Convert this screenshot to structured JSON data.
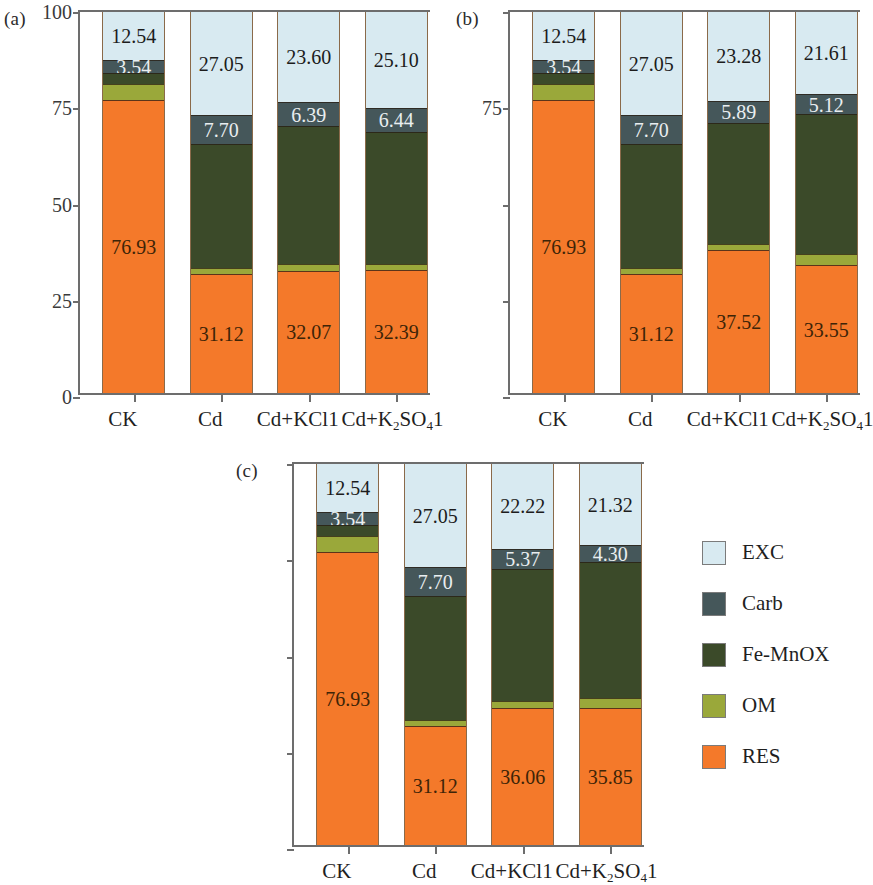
{
  "figure": {
    "series_order": [
      "RES",
      "OM",
      "Fe-MnOX",
      "Carb",
      "EXC"
    ],
    "colors": {
      "EXC": "#d8eaf1",
      "Carb": "#45575a",
      "Fe-MnOX": "#3b4a29",
      "OM": "#9aa83a",
      "RES": "#f4792a",
      "axis": "#6d6d6d",
      "bar_outline": "#8a6a4a"
    }
  },
  "legend": {
    "position": "right-middle",
    "items": [
      {
        "label": "EXC",
        "color": "#d8eaf1"
      },
      {
        "label": "Carb",
        "color": "#45575a"
      },
      {
        "label": "Fe-MnOX",
        "color": "#3b4a29"
      },
      {
        "label": "OM",
        "color": "#9aa83a"
      },
      {
        "label": "RES",
        "color": "#f4792a"
      }
    ]
  },
  "panels": [
    {
      "tag": "(a)",
      "ylabel": "百分比(%)",
      "ytick_labels": [
        "100",
        "75",
        "50",
        "25",
        "0"
      ],
      "ytick_values": [
        100,
        75,
        50,
        25,
        0
      ],
      "categories": [
        "CK",
        "Cd",
        "Cd+KCl1",
        "Cd+K2SO41"
      ],
      "category_labels_html": [
        "CK",
        "Cd",
        "Cd+KCl1",
        "Cd+K<sub>2</sub>SO<sub>4</sub>1"
      ],
      "bars": [
        {
          "category": "CK",
          "RES": 76.93,
          "OM": 4.1,
          "Fe-MnOX": 2.89,
          "Carb": 3.54,
          "EXC": 12.54,
          "labels": {
            "RES": "76.93",
            "Carb": "3.54",
            "EXC": "12.54"
          }
        },
        {
          "category": "Cd",
          "RES": 31.12,
          "OM": 1.63,
          "Fe-MnOX": 32.5,
          "Carb": 7.7,
          "EXC": 27.05,
          "labels": {
            "RES": "31.12",
            "Carb": "7.70",
            "EXC": "27.05"
          }
        },
        {
          "category": "Cd+KCl1",
          "RES": 32.07,
          "OM": 1.8,
          "Fe-MnOX": 36.14,
          "Carb": 6.39,
          "EXC": 23.6,
          "labels": {
            "RES": "32.07",
            "Carb": "6.39",
            "EXC": "23.60"
          }
        },
        {
          "category": "Cd+K2SO41",
          "RES": 32.39,
          "OM": 1.5,
          "Fe-MnOX": 34.57,
          "Carb": 6.44,
          "EXC": 25.1,
          "labels": {
            "RES": "32.39",
            "Carb": "6.44",
            "EXC": "25.10"
          }
        }
      ]
    },
    {
      "tag": "(b)",
      "ylabel": "",
      "ytick_labels": [
        "",
        "75",
        "",
        "",
        ""
      ],
      "ytick_values": [
        100,
        75,
        50,
        25,
        0
      ],
      "categories": [
        "CK",
        "Cd",
        "Cd+KCl1",
        "Cd+K2SO41"
      ],
      "category_labels_html": [
        "CK",
        "Cd",
        "Cd+KCl1",
        "Cd+K<sub>2</sub>SO<sub>4</sub>1"
      ],
      "bars": [
        {
          "category": "CK",
          "RES": 76.93,
          "OM": 4.1,
          "Fe-MnOX": 2.89,
          "Carb": 3.54,
          "EXC": 12.54,
          "labels": {
            "RES": "76.93",
            "Carb": "3.54",
            "EXC": "12.54"
          }
        },
        {
          "category": "Cd",
          "RES": 31.12,
          "OM": 1.63,
          "Fe-MnOX": 32.5,
          "Carb": 7.7,
          "EXC": 27.05,
          "labels": {
            "RES": "31.12",
            "Carb": "7.70",
            "EXC": "27.05"
          }
        },
        {
          "category": "Cd+KCl1",
          "RES": 37.52,
          "OM": 1.5,
          "Fe-MnOX": 31.81,
          "Carb": 5.89,
          "EXC": 23.28,
          "labels": {
            "RES": "37.52",
            "Carb": "5.89",
            "EXC": "23.28"
          }
        },
        {
          "category": "Cd+K2SO41",
          "RES": 33.55,
          "OM": 2.8,
          "Fe-MnOX": 36.92,
          "Carb": 5.12,
          "EXC": 21.61,
          "labels": {
            "RES": "33.55",
            "Carb": "5.12",
            "EXC": "21.61"
          }
        }
      ]
    },
    {
      "tag": "(c)",
      "ylabel": "",
      "ytick_labels": [
        "",
        "",
        "",
        "",
        ""
      ],
      "ytick_values": [
        100,
        75,
        50,
        25,
        0
      ],
      "categories": [
        "CK",
        "Cd",
        "Cd+KCl1",
        "Cd+K2SO41"
      ],
      "category_labels_html": [
        "CK",
        "Cd",
        "Cd+KCl1",
        "Cd+K<sub>2</sub>SO<sub>4</sub>1"
      ],
      "bars": [
        {
          "category": "CK",
          "RES": 76.93,
          "OM": 4.1,
          "Fe-MnOX": 2.89,
          "Carb": 3.54,
          "EXC": 12.54,
          "labels": {
            "RES": "76.93",
            "Carb": "3.54",
            "EXC": "12.54"
          }
        },
        {
          "category": "Cd",
          "RES": 31.12,
          "OM": 1.63,
          "Fe-MnOX": 32.5,
          "Carb": 7.7,
          "EXC": 27.05,
          "labels": {
            "RES": "31.12",
            "Carb": "7.70",
            "EXC": "27.05"
          }
        },
        {
          "category": "Cd+KCl1",
          "RES": 36.06,
          "OM": 1.7,
          "Fe-MnOX": 34.65,
          "Carb": 5.37,
          "EXC": 22.22,
          "labels": {
            "RES": "36.06",
            "Carb": "5.37",
            "EXC": "22.22"
          }
        },
        {
          "category": "Cd+K2SO41",
          "RES": 35.85,
          "OM": 2.6,
          "Fe-MnOX": 35.93,
          "Carb": 4.3,
          "EXC": 21.32,
          "labels": {
            "RES": "35.85",
            "Carb": "4.30",
            "EXC": "21.32"
          }
        }
      ]
    }
  ],
  "chart_data": {
    "type": "bar",
    "subtype": "stacked-100-percent",
    "title": "",
    "xlabel": "",
    "ylabel": "百分比(%)",
    "ylim": [
      0,
      100
    ],
    "yticks": [
      0,
      25,
      50,
      75,
      100
    ],
    "grid": false,
    "legend_position": "right",
    "categories": [
      "CK",
      "Cd",
      "Cd+KCl1",
      "Cd+K2SO41"
    ],
    "panels": [
      {
        "tag": "(a)",
        "series": [
          {
            "name": "RES",
            "values": [
              76.93,
              31.12,
              32.07,
              32.39
            ]
          },
          {
            "name": "OM",
            "values": [
              4.1,
              1.63,
              1.8,
              1.5
            ]
          },
          {
            "name": "Fe-MnOX",
            "values": [
              2.89,
              32.5,
              36.14,
              34.57
            ]
          },
          {
            "name": "Carb",
            "values": [
              3.54,
              7.7,
              6.39,
              6.44
            ]
          },
          {
            "name": "EXC",
            "values": [
              12.54,
              27.05,
              23.6,
              25.1
            ]
          }
        ]
      },
      {
        "tag": "(b)",
        "series": [
          {
            "name": "RES",
            "values": [
              76.93,
              31.12,
              37.52,
              33.55
            ]
          },
          {
            "name": "OM",
            "values": [
              4.1,
              1.63,
              1.5,
              2.8
            ]
          },
          {
            "name": "Fe-MnOX",
            "values": [
              2.89,
              32.5,
              31.81,
              36.92
            ]
          },
          {
            "name": "Carb",
            "values": [
              3.54,
              7.7,
              5.89,
              5.12
            ]
          },
          {
            "name": "EXC",
            "values": [
              12.54,
              27.05,
              23.28,
              21.61
            ]
          }
        ]
      },
      {
        "tag": "(c)",
        "series": [
          {
            "name": "RES",
            "values": [
              76.93,
              31.12,
              36.06,
              35.85
            ]
          },
          {
            "name": "OM",
            "values": [
              4.1,
              1.63,
              1.7,
              2.6
            ]
          },
          {
            "name": "Fe-MnOX",
            "values": [
              2.89,
              32.5,
              34.65,
              35.93
            ]
          },
          {
            "name": "Carb",
            "values": [
              3.54,
              7.7,
              5.37,
              4.3
            ]
          },
          {
            "name": "EXC",
            "values": [
              12.54,
              27.05,
              22.22,
              21.32
            ]
          }
        ]
      }
    ]
  }
}
